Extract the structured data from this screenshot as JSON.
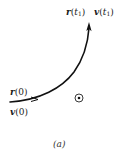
{
  "figure": {
    "caption": "(a)",
    "colors": {
      "stroke": "#111111",
      "text": "#1a1a1a",
      "background": "#ffffff"
    },
    "labels": {
      "r0": {
        "vector": "r",
        "arg": "(0)"
      },
      "v0": {
        "vector": "v",
        "arg": "(0)"
      },
      "rt1": {
        "vector": "r",
        "open": "(",
        "var": "t",
        "sub": "1",
        "close": ")"
      },
      "vt1": {
        "vector": "v",
        "open": "(",
        "var": "t",
        "sub": "1",
        "close": ")"
      }
    },
    "symbols": {
      "center": "dot-in-circle (vector out of page)"
    }
  }
}
